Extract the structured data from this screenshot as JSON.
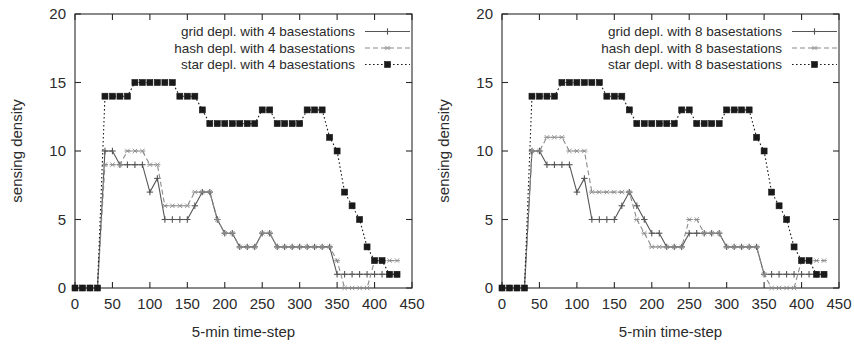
{
  "figure": {
    "background": "#ffffff",
    "ink": "#2b2b2b"
  },
  "chart_data": [
    {
      "type": "line",
      "panel": "left",
      "title": "",
      "xlabel": "5-min time-step",
      "ylabel": "sensing density",
      "xlim": [
        0,
        450
      ],
      "ylim": [
        0,
        20
      ],
      "xticks": [
        "0",
        "50",
        "100",
        "150",
        "200",
        "250",
        "300",
        "350",
        "400",
        "450"
      ],
      "yticks": [
        "0",
        "5",
        "10",
        "15",
        "20"
      ],
      "grid": false,
      "legend_position": "top-center",
      "series": [
        {
          "name": "grid depl. with 4 basestations",
          "marker": "plus",
          "linestyle": "solid",
          "color": "#555555",
          "x": [
            0,
            10,
            20,
            30,
            40,
            50,
            60,
            70,
            80,
            90,
            100,
            110,
            120,
            130,
            140,
            150,
            160,
            170,
            180,
            190,
            200,
            210,
            220,
            230,
            240,
            250,
            260,
            270,
            280,
            290,
            300,
            310,
            320,
            330,
            340,
            350,
            360,
            370,
            380,
            390,
            400,
            410,
            420,
            430
          ],
          "y": [
            0,
            0,
            0,
            0,
            10,
            10,
            9,
            9,
            9,
            9,
            7,
            8,
            5,
            5,
            5,
            5,
            6,
            7,
            7,
            5,
            4,
            4,
            3,
            3,
            3,
            4,
            4,
            3,
            3,
            3,
            3,
            3,
            3,
            3,
            3,
            1,
            1,
            1,
            1,
            1,
            1,
            1,
            1,
            1
          ]
        },
        {
          "name": "hash depl. with 4 basestations",
          "marker": "star",
          "linestyle": "dashed",
          "color": "#8a8a8a",
          "x": [
            0,
            10,
            20,
            30,
            40,
            50,
            60,
            70,
            80,
            90,
            100,
            110,
            120,
            130,
            140,
            150,
            160,
            170,
            180,
            190,
            200,
            210,
            220,
            230,
            240,
            250,
            260,
            270,
            280,
            290,
            300,
            310,
            320,
            330,
            340,
            350,
            360,
            370,
            380,
            390,
            400,
            410,
            420,
            430
          ],
          "y": [
            0,
            0,
            0,
            0,
            9,
            9,
            9,
            10,
            10,
            10,
            9,
            9,
            6,
            6,
            6,
            6,
            7,
            7,
            7,
            5,
            4,
            4,
            3,
            3,
            3,
            4,
            4,
            3,
            3,
            3,
            3,
            3,
            3,
            3,
            3,
            2,
            0,
            0,
            0,
            0,
            2,
            2,
            2,
            2
          ]
        },
        {
          "name": "star depl. with 4 basestations",
          "marker": "filled-square",
          "linestyle": "dotted",
          "color": "#1a1a1a",
          "x": [
            0,
            10,
            20,
            30,
            40,
            50,
            60,
            70,
            80,
            90,
            100,
            110,
            120,
            130,
            140,
            150,
            160,
            170,
            180,
            190,
            200,
            210,
            220,
            230,
            240,
            250,
            260,
            270,
            280,
            290,
            300,
            310,
            320,
            330,
            340,
            350,
            360,
            370,
            380,
            390,
            400,
            410,
            420,
            430
          ],
          "y": [
            0,
            0,
            0,
            0,
            14,
            14,
            14,
            14,
            15,
            15,
            15,
            15,
            15,
            15,
            14,
            14,
            14,
            13,
            12,
            12,
            12,
            12,
            12,
            12,
            12,
            13,
            13,
            12,
            12,
            12,
            12,
            13,
            13,
            13,
            11,
            10,
            7,
            6,
            5,
            3,
            2,
            2,
            1,
            1
          ]
        }
      ]
    },
    {
      "type": "line",
      "panel": "right",
      "title": "",
      "xlabel": "5-min time-step",
      "ylabel": "sensing density",
      "xlim": [
        0,
        450
      ],
      "ylim": [
        0,
        20
      ],
      "xticks": [
        "0",
        "50",
        "100",
        "150",
        "200",
        "250",
        "300",
        "350",
        "400",
        "450"
      ],
      "yticks": [
        "0",
        "5",
        "10",
        "15",
        "20"
      ],
      "grid": false,
      "legend_position": "top-center",
      "series": [
        {
          "name": "grid depl. with 8 basestations",
          "marker": "plus",
          "linestyle": "solid",
          "color": "#555555",
          "x": [
            0,
            10,
            20,
            30,
            40,
            50,
            60,
            70,
            80,
            90,
            100,
            110,
            120,
            130,
            140,
            150,
            160,
            170,
            180,
            190,
            200,
            210,
            220,
            230,
            240,
            250,
            260,
            270,
            280,
            290,
            300,
            310,
            320,
            330,
            340,
            350,
            360,
            370,
            380,
            390,
            400,
            410,
            420,
            430
          ],
          "y": [
            0,
            0,
            0,
            0,
            10,
            10,
            9,
            9,
            9,
            9,
            7,
            8,
            5,
            5,
            5,
            5,
            6,
            7,
            6,
            5,
            4,
            4,
            3,
            3,
            3,
            4,
            4,
            4,
            4,
            4,
            3,
            3,
            3,
            3,
            3,
            1,
            1,
            1,
            1,
            1,
            1,
            1,
            1,
            1
          ]
        },
        {
          "name": "hash depl. with 8 basestations",
          "marker": "star",
          "linestyle": "dashed",
          "color": "#8a8a8a",
          "x": [
            0,
            10,
            20,
            30,
            40,
            50,
            60,
            70,
            80,
            90,
            100,
            110,
            120,
            130,
            140,
            150,
            160,
            170,
            180,
            190,
            200,
            210,
            220,
            230,
            240,
            250,
            260,
            270,
            280,
            290,
            300,
            310,
            320,
            330,
            340,
            350,
            360,
            370,
            380,
            390,
            400,
            410,
            420,
            430
          ],
          "y": [
            0,
            0,
            0,
            0,
            10,
            10,
            11,
            11,
            11,
            10,
            10,
            10,
            7,
            7,
            7,
            7,
            7,
            7,
            5,
            4,
            3,
            3,
            3,
            3,
            3,
            5,
            5,
            4,
            4,
            4,
            3,
            3,
            3,
            3,
            3,
            1,
            0,
            0,
            0,
            0,
            2,
            2,
            2,
            2
          ]
        },
        {
          "name": "star depl. with 8 basestations",
          "marker": "filled-square",
          "linestyle": "dotted",
          "color": "#1a1a1a",
          "x": [
            0,
            10,
            20,
            30,
            40,
            50,
            60,
            70,
            80,
            90,
            100,
            110,
            120,
            130,
            140,
            150,
            160,
            170,
            180,
            190,
            200,
            210,
            220,
            230,
            240,
            250,
            260,
            270,
            280,
            290,
            300,
            310,
            320,
            330,
            340,
            350,
            360,
            370,
            380,
            390,
            400,
            410,
            420,
            430
          ],
          "y": [
            0,
            0,
            0,
            0,
            14,
            14,
            14,
            14,
            15,
            15,
            15,
            15,
            15,
            15,
            14,
            14,
            14,
            13,
            12,
            12,
            12,
            12,
            12,
            12,
            13,
            13,
            12,
            12,
            12,
            12,
            13,
            13,
            13,
            13,
            11,
            10,
            7,
            6,
            5,
            3,
            2,
            2,
            1,
            1
          ]
        }
      ]
    }
  ]
}
